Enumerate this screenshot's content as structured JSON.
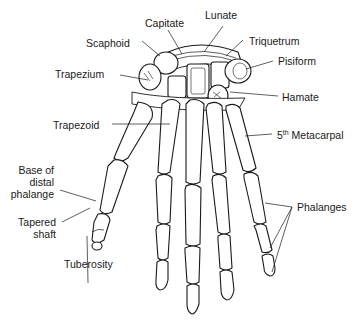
{
  "diagram": {
    "labels": {
      "capitate": "Capitate",
      "lunate": "Lunate",
      "scaphoid": "Scaphoid",
      "triquetrum": "Triquetrum",
      "pisiform": "Pisiform",
      "trapezium": "Trapezium",
      "hamate": "Hamate",
      "trapezoid": "Trapezoid",
      "metacarpal_num": "5",
      "metacarpal_sup": "th",
      "metacarpal_text": " Metacarpal",
      "base_line1": "Base of",
      "base_line2": "distal",
      "base_line3": "phalange",
      "tapered_line1": "Tapered",
      "tapered_line2": "shaft",
      "tuberosity": "Tuberosity",
      "phalanges": "Phalanges"
    },
    "colors": {
      "line": "#1a1a1a",
      "bone": "#ffffff"
    }
  }
}
